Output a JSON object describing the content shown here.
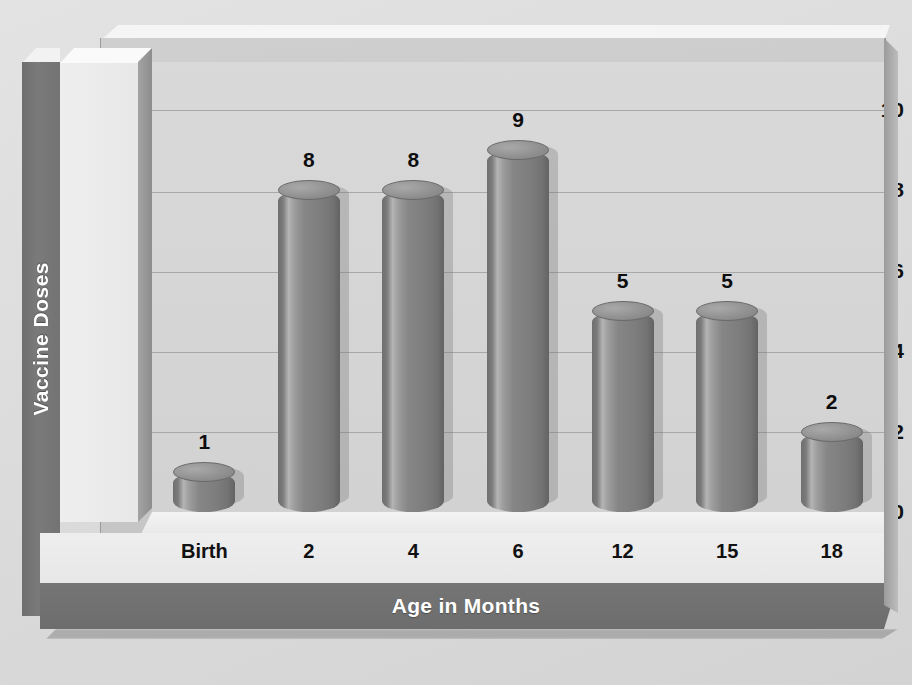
{
  "chart_data": {
    "type": "bar",
    "title": "",
    "xlabel": "Age in Months",
    "ylabel": "Vaccine Doses",
    "categories": [
      "Birth",
      "2",
      "4",
      "6",
      "12",
      "15",
      "18"
    ],
    "values": [
      1,
      8,
      8,
      9,
      5,
      5,
      2
    ],
    "ylim": [
      0,
      10
    ],
    "yticks": [
      0,
      2,
      4,
      6,
      8,
      10
    ],
    "ytick_labels": [
      "0",
      "2",
      "4",
      "6",
      "8",
      "10"
    ],
    "grid": true,
    "legend": false,
    "legend_position": "none",
    "style": "3d-cylinder",
    "series": [
      {
        "name": "Vaccine Doses",
        "values": [
          1,
          8,
          8,
          9,
          5,
          5,
          2
        ]
      }
    ],
    "data_labels": [
      "1",
      "8",
      "8",
      "9",
      "5",
      "5",
      "2"
    ]
  },
  "axes": {
    "y_title": "Vaccine Doses",
    "x_title": "Age in Months"
  },
  "colors": {
    "bar": "#868686",
    "bar_highlight": "#b4b4b4",
    "bar_dark": "#636363",
    "plot_wall": "#d6d6d6",
    "outer_background": "#dcdcdc",
    "band": "#737373",
    "band_text": "#ffffff",
    "tick_text": "#111111",
    "gridline": "#a8a8a8"
  }
}
